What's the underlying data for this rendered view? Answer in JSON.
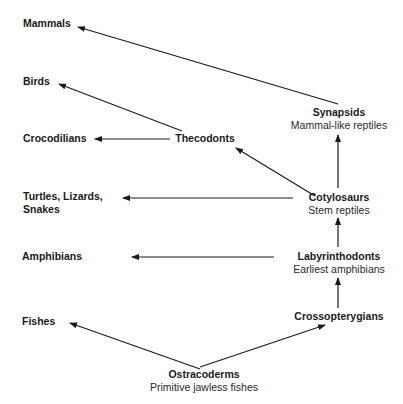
{
  "diagram": {
    "title": "",
    "nodes": {
      "mammals": {
        "label": "Mammals"
      },
      "birds": {
        "label": "Birds"
      },
      "crocodilians": {
        "label": "Crocodilians"
      },
      "turtles": {
        "label": "Turtles, Lizards,",
        "label2": "Snakes"
      },
      "amphibians": {
        "label": "Amphibians"
      },
      "fishes": {
        "label": "Fishes"
      },
      "thecodonts": {
        "label": "Thecodonts"
      },
      "synapsids": {
        "label": "Synapsids",
        "sub": "Mammal-like reptiles"
      },
      "cotylosaurs": {
        "label": "Cotylosaurs",
        "sub": "Stem reptiles"
      },
      "labyrinthodonts": {
        "label": "Labyrinthodonts",
        "sub": "Earliest amphibians"
      },
      "crossopterygians": {
        "label": "Crossopterygians"
      },
      "ostracoderms": {
        "label": "Ostracoderms",
        "sub": "Primitive jawless fishes"
      }
    },
    "edges": [
      {
        "from": "Ostracoderms",
        "to": "Fishes"
      },
      {
        "from": "Ostracoderms",
        "to": "Crossopterygians"
      },
      {
        "from": "Crossopterygians",
        "to": "Labyrinthodonts"
      },
      {
        "from": "Labyrinthodonts",
        "to": "Amphibians"
      },
      {
        "from": "Labyrinthodonts",
        "to": "Cotylosaurs"
      },
      {
        "from": "Cotylosaurs",
        "to": "Turtles, Lizards, Snakes"
      },
      {
        "from": "Cotylosaurs",
        "to": "Thecodonts"
      },
      {
        "from": "Cotylosaurs",
        "to": "Synapsids"
      },
      {
        "from": "Thecodonts",
        "to": "Crocodilians"
      },
      {
        "from": "Thecodonts",
        "to": "Birds"
      },
      {
        "from": "Synapsids",
        "to": "Mammals"
      }
    ]
  }
}
